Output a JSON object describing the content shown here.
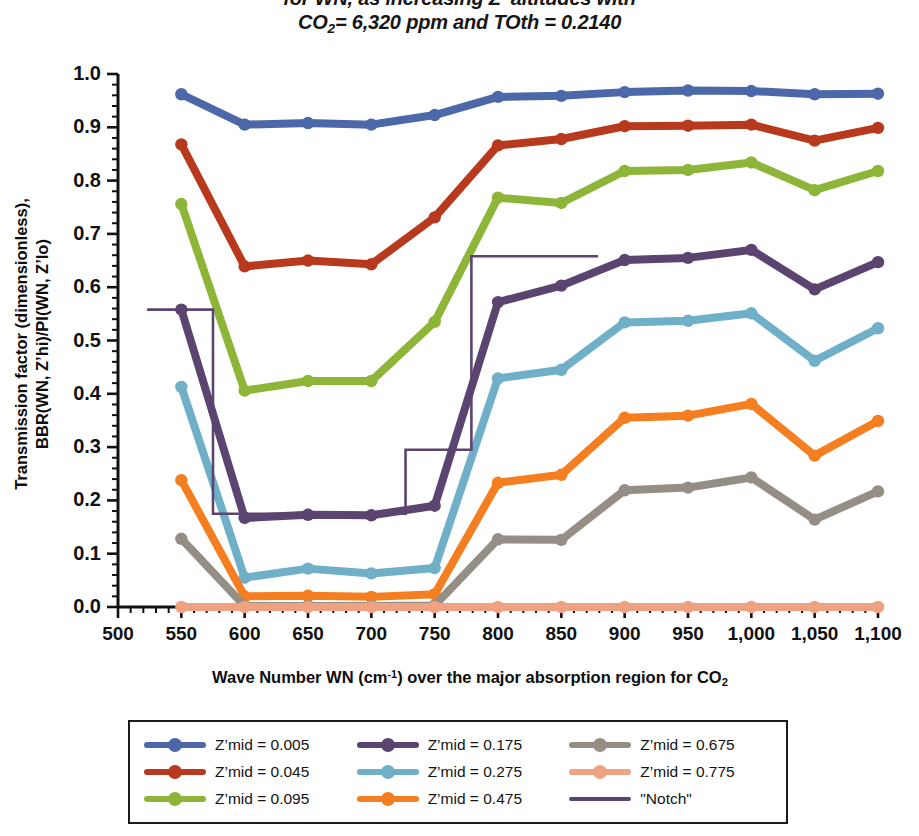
{
  "title": {
    "line1": "for WN, as increasing Z' altitudes with",
    "line2_pre": "CO",
    "line2_sub": "2",
    "line2_post": "= 6,320 ppm and TOth = 0.2140"
  },
  "axis": {
    "ylabel_line1": "Transmission factor (dimensionless),",
    "ylabel_line2": "BBR(WN, Z’hi)/PI(WN, Z’lo)",
    "xlabel_pre": "Wave Number WN (cm",
    "xlabel_sup": "-1",
    "xlabel_mid": ") over the major absorption region for CO",
    "xlabel_sub": "2"
  },
  "chart_data": {
    "type": "line",
    "title": "for WN, as increasing Z' altitudes with CO2= 6,320 ppm and TOth = 0.2140",
    "xlabel": "Wave Number WN (cm-1) over the major absorption region for CO2",
    "ylabel": "Transmission factor (dimensionless), BBR(WN, Z'hi)/PI(WN, Z'lo)",
    "xlim": [
      500,
      1100
    ],
    "ylim": [
      0.0,
      1.0
    ],
    "xticks": [
      500,
      550,
      600,
      650,
      700,
      750,
      800,
      850,
      900,
      950,
      1000,
      1050,
      1100
    ],
    "xticklabels": [
      "500",
      "550",
      "600",
      "650",
      "700",
      "750",
      "800",
      "850",
      "900",
      "950",
      "1,000",
      "1,050",
      "1,100"
    ],
    "yticks": [
      0.0,
      0.1,
      0.2,
      0.3,
      0.4,
      0.5,
      0.6,
      0.7,
      0.8,
      0.9,
      1.0
    ],
    "yticklabels": [
      "0.0",
      "0.1",
      "0.2",
      "0.3",
      "0.4",
      "0.5",
      "0.6",
      "0.7",
      "0.8",
      "0.9",
      "1.0"
    ],
    "grid": false,
    "minor_ticks_x": 5,
    "minor_ticks_y": 5,
    "legend_position": "below",
    "x": [
      550,
      600,
      650,
      700,
      750,
      800,
      850,
      900,
      950,
      1000,
      1050,
      1100
    ],
    "series": [
      {
        "name": "Z’mid = 0.005",
        "label": "Z’mid = 0.005",
        "color": "#4C68A8",
        "marker": true,
        "values": [
          0.962,
          0.905,
          0.908,
          0.905,
          0.923,
          0.957,
          0.959,
          0.966,
          0.969,
          0.968,
          0.962,
          0.963
        ]
      },
      {
        "name": "Z’mid = 0.045",
        "label": "Z’mid = 0.045",
        "color": "#B8391D",
        "marker": true,
        "values": [
          0.868,
          0.639,
          0.65,
          0.643,
          0.731,
          0.866,
          0.878,
          0.902,
          0.903,
          0.905,
          0.875,
          0.899
        ]
      },
      {
        "name": "Z’mid = 0.095",
        "label": "Z’mid = 0.095",
        "color": "#8DB639",
        "marker": true,
        "values": [
          0.756,
          0.406,
          0.424,
          0.424,
          0.535,
          0.768,
          0.758,
          0.818,
          0.82,
          0.834,
          0.782,
          0.818
        ]
      },
      {
        "name": "Z’mid = 0.175",
        "label": "Z’mid = 0.175",
        "color": "#5B4570",
        "marker": true,
        "values": [
          0.558,
          0.167,
          0.173,
          0.172,
          0.19,
          0.572,
          0.603,
          0.651,
          0.655,
          0.67,
          0.596,
          0.647
        ]
      },
      {
        "name": "Z’mid = 0.275",
        "label": "Z’mid = 0.275",
        "color": "#6FAFC8",
        "marker": true,
        "values": [
          0.413,
          0.055,
          0.072,
          0.063,
          0.073,
          0.429,
          0.445,
          0.534,
          0.537,
          0.551,
          0.462,
          0.523
        ]
      },
      {
        "name": "Z’mid = 0.475",
        "label": "Z’mid = 0.475",
        "color": "#F57E20",
        "marker": true,
        "values": [
          0.238,
          0.02,
          0.021,
          0.019,
          0.024,
          0.233,
          0.248,
          0.355,
          0.359,
          0.381,
          0.284,
          0.349
        ]
      },
      {
        "name": "Z’mid = 0.675",
        "label": "Z’mid = 0.675",
        "color": "#958E84",
        "marker": true,
        "values": [
          0.128,
          0.002,
          0.002,
          0.002,
          0.003,
          0.127,
          0.126,
          0.219,
          0.224,
          0.243,
          0.164,
          0.217
        ]
      },
      {
        "name": "Z’mid = 0.775",
        "label": "Z’mid = 0.775",
        "color": "#EFA282",
        "marker": true,
        "values": [
          0.0,
          0.0,
          0.0,
          0.0,
          0.0,
          0.0,
          0.0,
          0.0,
          0.0,
          0.0,
          0.0,
          0.0
        ]
      },
      {
        "name": "Notch",
        "label": "\"Notch\"",
        "color": "#5B4570",
        "marker": false,
        "step": true,
        "step_points": [
          [
            523,
            0.558
          ],
          [
            575,
            0.558
          ],
          [
            575,
            0.175
          ],
          [
            727,
            0.175
          ],
          [
            727,
            0.295
          ],
          [
            779,
            0.295
          ],
          [
            779,
            0.658
          ],
          [
            879,
            0.658
          ]
        ]
      }
    ]
  },
  "legend": {
    "entries": [
      {
        "label": "Z’mid = 0.005",
        "color": "#4C68A8",
        "thin": false
      },
      {
        "label": "Z’mid = 0.045",
        "color": "#B8391D",
        "thin": false
      },
      {
        "label": "Z’mid = 0.095",
        "color": "#8DB639",
        "thin": false
      },
      {
        "label": "Z’mid = 0.175",
        "color": "#5B4570",
        "thin": false
      },
      {
        "label": "Z’mid = 0.275",
        "color": "#6FAFC8",
        "thin": false
      },
      {
        "label": "Z’mid = 0.475",
        "color": "#F57E20",
        "thin": false
      },
      {
        "label": "Z’mid = 0.675",
        "color": "#958E84",
        "thin": false
      },
      {
        "label": "Z’mid = 0.775",
        "color": "#EFA282",
        "thin": false
      },
      {
        "label": "\"Notch\"",
        "color": "#5B4570",
        "thin": true
      }
    ]
  }
}
